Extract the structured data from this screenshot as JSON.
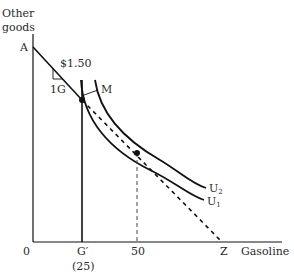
{
  "axes": {
    "y_label_line1": "Other",
    "y_label_line2": "goods",
    "x_label": "Gasoline",
    "origin_label": "0"
  },
  "points": {
    "A": "A",
    "M": "M",
    "Z": "Z"
  },
  "x_ticks": {
    "g_prime": "G′",
    "g_prime_value": "(25)",
    "fifty": "50"
  },
  "slope_annotation": {
    "price": "$1.50",
    "unit": "1G"
  },
  "curves": {
    "u1": "U",
    "u1_sub": "1",
    "u2": "U",
    "u2_sub": "2"
  },
  "colors": {
    "ink": "#111111",
    "text": "#2a2a2a",
    "dashed": "#444444"
  }
}
